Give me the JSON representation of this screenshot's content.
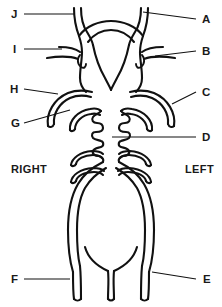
{
  "diagram": {
    "type": "anatomical-line-drawing",
    "stroke_color": "#111111",
    "background_color": "#ffffff",
    "leader_color": "#111111"
  },
  "orientation": {
    "right_label": "RIGHT",
    "left_label": "LEFT"
  },
  "labels": [
    {
      "id": "J",
      "text": "J",
      "side": "left",
      "x": 14,
      "y": 14
    },
    {
      "id": "I",
      "text": "I",
      "side": "left",
      "x": 15,
      "y": 49
    },
    {
      "id": "H",
      "text": "H",
      "side": "left",
      "x": 13,
      "y": 89
    },
    {
      "id": "G",
      "text": "G",
      "side": "left",
      "x": 13,
      "y": 125
    },
    {
      "id": "F",
      "text": "F",
      "side": "left",
      "x": 14,
      "y": 279
    },
    {
      "id": "A",
      "text": "A",
      "side": "right",
      "x": 200,
      "y": 19
    },
    {
      "id": "B",
      "text": "B",
      "side": "right",
      "x": 200,
      "y": 51
    },
    {
      "id": "C",
      "text": "C",
      "side": "right",
      "x": 200,
      "y": 92
    },
    {
      "id": "D",
      "text": "D",
      "side": "right",
      "x": 200,
      "y": 137
    },
    {
      "id": "E",
      "text": "E",
      "side": "right",
      "x": 201,
      "y": 279
    }
  ]
}
